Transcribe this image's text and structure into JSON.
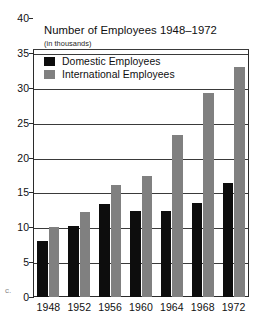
{
  "chart_data": {
    "type": "bar",
    "title": "Number of Employees 1948–1972",
    "subtitle": "(in thousands)",
    "xlabel": "",
    "ylabel": "",
    "ylim": [
      0,
      40
    ],
    "ytick_step": 5,
    "yticks": [
      "0",
      "5",
      "10",
      "15",
      "20",
      "25",
      "30",
      "35",
      "40"
    ],
    "categories": [
      "1948",
      "1952",
      "1956",
      "1960",
      "1964",
      "1968",
      "1972"
    ],
    "grid": true,
    "legend_position": "top-left-inside",
    "series": [
      {
        "name": "Domestic Employees",
        "color": "#0d0d0d",
        "values": [
          8.0,
          10.2,
          13.3,
          12.3,
          12.3,
          13.5,
          16.3
        ]
      },
      {
        "name": "International Employees",
        "color": "#808080",
        "values": [
          10.0,
          12.2,
          16.0,
          17.4,
          23.2,
          29.2,
          33.0
        ]
      }
    ]
  },
  "colors": {
    "domestic": "#0d0d0d",
    "international": "#808080",
    "axis": "#2b2b2b",
    "grid": "#3a3a3a",
    "background": "#ffffff"
  },
  "artifact": {
    "left_margin_mark": "c."
  }
}
